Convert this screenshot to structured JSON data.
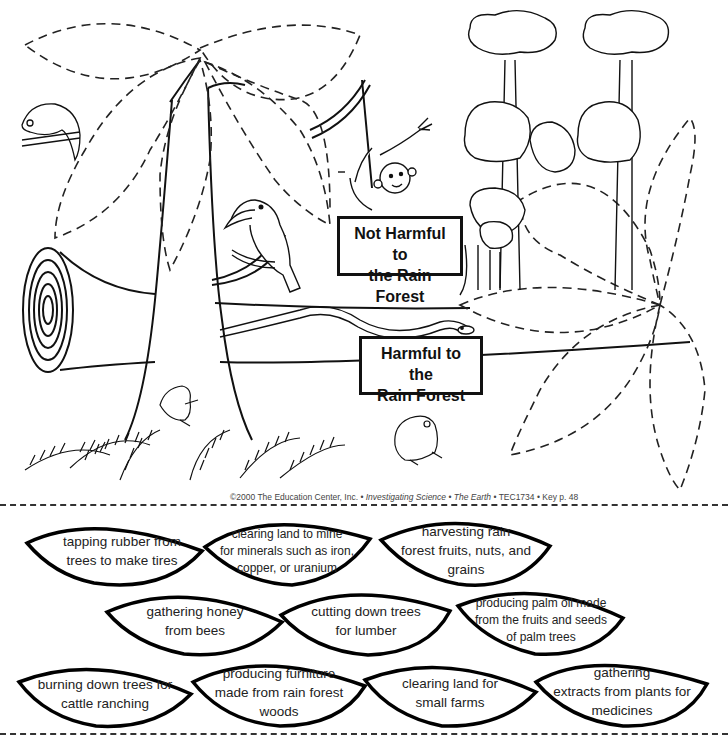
{
  "worksheet": {
    "signs": {
      "not_harmful": {
        "line1": "Not Harmful to",
        "line2": "the Rain Forest"
      },
      "harmful": {
        "line1": "Harmful to the",
        "line2": "Rain Forest"
      }
    },
    "copyright": {
      "prefix": "©2000 The Education Center, Inc. • ",
      "book": "Investigating Science",
      "sep1": " • ",
      "volume": "The Earth",
      "suffix": " • TEC1734 • Key p. 48"
    },
    "illustration": {
      "icons": [
        "chameleon-icon",
        "monkey-icon",
        "toucan-icon",
        "snake-icon",
        "frog-icon",
        "toad-icon",
        "log-icon",
        "fern-icon",
        "rainforest-trees-icon",
        "dashed-leaf-outline-icon"
      ]
    }
  },
  "cards": [
    {
      "id": "rubber",
      "lines": [
        "tapping rubber from",
        "trees to make tires"
      ]
    },
    {
      "id": "mine",
      "lines": [
        "clearing land to mine",
        "for minerals such as iron,",
        "copper, or uranium"
      ]
    },
    {
      "id": "fruits",
      "lines": [
        "harvesting rain",
        "forest fruits, nuts, and",
        "grains"
      ]
    },
    {
      "id": "honey",
      "lines": [
        "gathering honey",
        "from bees"
      ]
    },
    {
      "id": "lumber",
      "lines": [
        "cutting down trees",
        "for lumber"
      ]
    },
    {
      "id": "palm",
      "lines": [
        "producing palm oil made",
        "from the fruits and seeds",
        "of palm trees"
      ]
    },
    {
      "id": "cattle",
      "lines": [
        "burning down trees for",
        "cattle ranching"
      ]
    },
    {
      "id": "furniture",
      "lines": [
        "producing furniture",
        "made from rain forest",
        "woods"
      ]
    },
    {
      "id": "farms",
      "lines": [
        "clearing land for",
        "small farms"
      ]
    },
    {
      "id": "medicines",
      "lines": [
        "gathering",
        "extracts from plants for",
        "medicines"
      ]
    }
  ]
}
